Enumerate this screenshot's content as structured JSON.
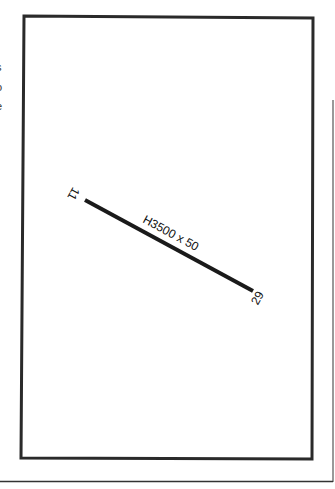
{
  "airport_diagram": {
    "runway": {
      "designation": "H3500 x 50",
      "end_a_label": "11",
      "end_b_label": "29",
      "end_a": {
        "x": 85,
        "y": 200
      },
      "end_b": {
        "x": 253,
        "y": 291
      }
    },
    "edge_glyphs": [
      "s",
      "o",
      "e",
      "'"
    ],
    "colors": {
      "frame": "#2a2a2a",
      "runway": "#1a1a1a",
      "background": "#ffffff"
    }
  }
}
